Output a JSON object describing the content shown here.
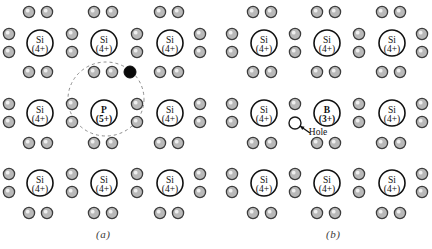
{
  "figure": {
    "background_color": "#ffffff",
    "width": 432,
    "height": 249
  },
  "colors": {
    "electron_fill": "#b9b9b9",
    "electron_stroke": "#3c3c3c",
    "free_electron_fill": "#0a0a0a",
    "hole_fill": "#ffffff",
    "hole_stroke": "#1a1a1a",
    "core_stroke": "#111111",
    "core_fill": "#ffffff",
    "orbit_stroke": "#8d8d8d",
    "text_color": "#111111",
    "caption_color": "#3a3a3a"
  },
  "panels": [
    {
      "id": "a",
      "caption": "(a)",
      "caption_x": 96,
      "caption_y": 228,
      "description": "n-type silicon doped with phosphorus",
      "cores": [
        {
          "name": "si-core-a-r1c1",
          "element": "Si",
          "charge": "(4+)",
          "cx": 40,
          "cy": 43
        },
        {
          "name": "si-core-a-r1c2",
          "element": "Si",
          "charge": "(4+)",
          "cx": 104,
          "cy": 43
        },
        {
          "name": "si-core-a-r1c3",
          "element": "Si",
          "charge": "(4+)",
          "cx": 170,
          "cy": 43
        },
        {
          "name": "si-core-a-r2c1",
          "element": "Si",
          "charge": "(4+)",
          "cx": 40,
          "cy": 113
        },
        {
          "name": "p-core-a-r2c2",
          "element": "P",
          "charge": "(5+)",
          "cx": 104,
          "cy": 113
        },
        {
          "name": "si-core-a-r2c3",
          "element": "Si",
          "charge": "(4+)",
          "cx": 170,
          "cy": 113
        },
        {
          "name": "si-core-a-r3c1",
          "element": "Si",
          "charge": "(4+)",
          "cx": 40,
          "cy": 183
        },
        {
          "name": "si-core-a-r3c2",
          "element": "Si",
          "charge": "(4+)",
          "cx": 104,
          "cy": 183
        },
        {
          "name": "si-core-a-r3c3",
          "element": "Si",
          "charge": "(4+)",
          "cx": 170,
          "cy": 183
        }
      ],
      "electrons": [
        {
          "cx": 29,
          "cy": 12
        },
        {
          "cx": 47,
          "cy": 12
        },
        {
          "cx": 94,
          "cy": 12
        },
        {
          "cx": 112,
          "cy": 12
        },
        {
          "cx": 160,
          "cy": 12
        },
        {
          "cx": 178,
          "cy": 12
        },
        {
          "cx": 9,
          "cy": 34
        },
        {
          "cx": 9,
          "cy": 52
        },
        {
          "cx": 72,
          "cy": 34
        },
        {
          "cx": 72,
          "cy": 52
        },
        {
          "cx": 137,
          "cy": 34
        },
        {
          "cx": 137,
          "cy": 52
        },
        {
          "cx": 200,
          "cy": 34
        },
        {
          "cx": 200,
          "cy": 52
        },
        {
          "cx": 29,
          "cy": 72
        },
        {
          "cx": 47,
          "cy": 72
        },
        {
          "cx": 94,
          "cy": 72
        },
        {
          "cx": 112,
          "cy": 72
        },
        {
          "cx": 160,
          "cy": 72
        },
        {
          "cx": 178,
          "cy": 72
        },
        {
          "cx": 9,
          "cy": 104
        },
        {
          "cx": 9,
          "cy": 122
        },
        {
          "cx": 72,
          "cy": 104
        },
        {
          "cx": 72,
          "cy": 122
        },
        {
          "cx": 137,
          "cy": 104
        },
        {
          "cx": 137,
          "cy": 122
        },
        {
          "cx": 200,
          "cy": 104
        },
        {
          "cx": 200,
          "cy": 122
        },
        {
          "cx": 29,
          "cy": 143
        },
        {
          "cx": 47,
          "cy": 143
        },
        {
          "cx": 94,
          "cy": 143
        },
        {
          "cx": 112,
          "cy": 143
        },
        {
          "cx": 160,
          "cy": 143
        },
        {
          "cx": 178,
          "cy": 143
        },
        {
          "cx": 9,
          "cy": 174
        },
        {
          "cx": 9,
          "cy": 192
        },
        {
          "cx": 72,
          "cy": 174
        },
        {
          "cx": 72,
          "cy": 192
        },
        {
          "cx": 137,
          "cy": 174
        },
        {
          "cx": 137,
          "cy": 192
        },
        {
          "cx": 200,
          "cy": 174
        },
        {
          "cx": 200,
          "cy": 192
        },
        {
          "cx": 29,
          "cy": 213
        },
        {
          "cx": 47,
          "cy": 213
        },
        {
          "cx": 94,
          "cy": 213
        },
        {
          "cx": 112,
          "cy": 213
        },
        {
          "cx": 160,
          "cy": 213
        },
        {
          "cx": 178,
          "cy": 213
        }
      ],
      "free_electron": {
        "name": "free-electron",
        "cx": 130,
        "cy": 72,
        "r": 6
      },
      "orbit": {
        "name": "donor-orbit",
        "cx": 106,
        "cy": 99,
        "rx": 38,
        "ry": 37
      }
    },
    {
      "id": "b",
      "caption": "(b)",
      "caption_x": 326,
      "caption_y": 228,
      "description": "p-type silicon doped with boron",
      "cores": [
        {
          "name": "si-core-b-r1c1",
          "element": "Si",
          "charge": "(4+)",
          "cx": 264,
          "cy": 43
        },
        {
          "name": "si-core-b-r1c2",
          "element": "Si",
          "charge": "(4+)",
          "cx": 327,
          "cy": 43
        },
        {
          "name": "si-core-b-r1c3",
          "element": "Si",
          "charge": "(4+)",
          "cx": 392,
          "cy": 43
        },
        {
          "name": "si-core-b-r2c1",
          "element": "Si",
          "charge": "(4+)",
          "cx": 264,
          "cy": 113
        },
        {
          "name": "b-core-b-r2c2",
          "element": "B",
          "charge": "(3+)",
          "cx": 327,
          "cy": 113
        },
        {
          "name": "si-core-b-r2c3",
          "element": "Si",
          "charge": "(4+)",
          "cx": 392,
          "cy": 113
        },
        {
          "name": "si-core-b-r3c1",
          "element": "Si",
          "charge": "(4+)",
          "cx": 264,
          "cy": 183
        },
        {
          "name": "si-core-b-r3c2",
          "element": "Si",
          "charge": "(4+)",
          "cx": 327,
          "cy": 183
        },
        {
          "name": "si-core-b-r3c3",
          "element": "Si",
          "charge": "(4+)",
          "cx": 392,
          "cy": 183
        }
      ],
      "electrons": [
        {
          "cx": 253,
          "cy": 12
        },
        {
          "cx": 271,
          "cy": 12
        },
        {
          "cx": 317,
          "cy": 12
        },
        {
          "cx": 335,
          "cy": 12
        },
        {
          "cx": 382,
          "cy": 12
        },
        {
          "cx": 400,
          "cy": 12
        },
        {
          "cx": 232,
          "cy": 34
        },
        {
          "cx": 232,
          "cy": 52
        },
        {
          "cx": 295,
          "cy": 34
        },
        {
          "cx": 295,
          "cy": 52
        },
        {
          "cx": 359,
          "cy": 34
        },
        {
          "cx": 359,
          "cy": 52
        },
        {
          "cx": 422,
          "cy": 34
        },
        {
          "cx": 422,
          "cy": 52
        },
        {
          "cx": 253,
          "cy": 72
        },
        {
          "cx": 271,
          "cy": 72
        },
        {
          "cx": 317,
          "cy": 72
        },
        {
          "cx": 335,
          "cy": 72
        },
        {
          "cx": 382,
          "cy": 72
        },
        {
          "cx": 400,
          "cy": 72
        },
        {
          "cx": 232,
          "cy": 104
        },
        {
          "cx": 232,
          "cy": 122
        },
        {
          "cx": 295,
          "cy": 104
        },
        {
          "cx": 359,
          "cy": 104
        },
        {
          "cx": 359,
          "cy": 122
        },
        {
          "cx": 422,
          "cy": 104
        },
        {
          "cx": 422,
          "cy": 122
        },
        {
          "cx": 253,
          "cy": 143
        },
        {
          "cx": 271,
          "cy": 143
        },
        {
          "cx": 317,
          "cy": 143
        },
        {
          "cx": 335,
          "cy": 143
        },
        {
          "cx": 382,
          "cy": 143
        },
        {
          "cx": 400,
          "cy": 143
        },
        {
          "cx": 232,
          "cy": 174
        },
        {
          "cx": 232,
          "cy": 192
        },
        {
          "cx": 295,
          "cy": 174
        },
        {
          "cx": 295,
          "cy": 192
        },
        {
          "cx": 359,
          "cy": 174
        },
        {
          "cx": 359,
          "cy": 192
        },
        {
          "cx": 422,
          "cy": 174
        },
        {
          "cx": 422,
          "cy": 192
        },
        {
          "cx": 253,
          "cy": 213
        },
        {
          "cx": 271,
          "cy": 213
        },
        {
          "cx": 317,
          "cy": 213
        },
        {
          "cx": 335,
          "cy": 213
        },
        {
          "cx": 382,
          "cy": 213
        },
        {
          "cx": 400,
          "cy": 213
        }
      ],
      "hole": {
        "name": "hole-marker",
        "cx": 295,
        "cy": 123,
        "r": 6,
        "label": "Hole",
        "label_x": 318,
        "label_y": 135,
        "arrow_from_x": 310,
        "arrow_from_y": 133,
        "arrow_to_x": 300,
        "arrow_to_y": 126
      }
    }
  ]
}
